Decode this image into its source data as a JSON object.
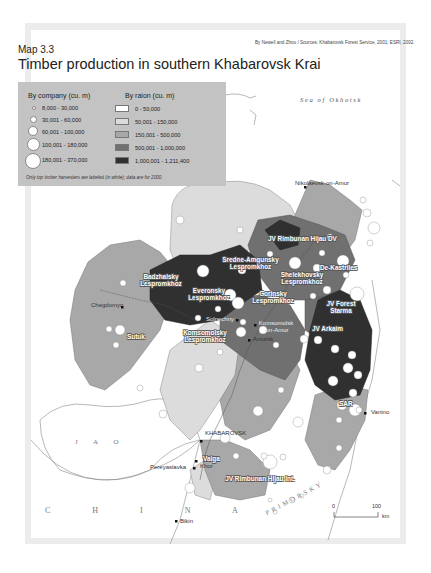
{
  "header": {
    "credit": "By Newell and Zhou / Sources: Khabarovsk Forest Service, 2001; ESRI, 2002.",
    "map_number": "Map 3.3",
    "title": "Timber production in southern Khabarovsk Krai"
  },
  "legend": {
    "company_heading": "By company (cu. m)",
    "company_classes": [
      {
        "label": "8,000 - 30,000",
        "size": 4
      },
      {
        "label": "30,001 - 60,000",
        "size": 7
      },
      {
        "label": "60,001 - 100,000",
        "size": 10
      },
      {
        "label": "100,001 - 180,000",
        "size": 13
      },
      {
        "label": "180,001 - 370,000",
        "size": 16
      }
    ],
    "raion_heading": "By raion (cu. m)",
    "raion_classes": [
      {
        "label": "0 - 50,000",
        "color": "#ffffff"
      },
      {
        "label": "50,001 - 150,000",
        "color": "#dcdcdc"
      },
      {
        "label": "150,001 - 500,000",
        "color": "#a8a8a8"
      },
      {
        "label": "500,001 - 1,000,000",
        "color": "#707070"
      },
      {
        "label": "1,000,001 - 1,211,400",
        "color": "#303030"
      }
    ],
    "note": "Only top timber harvesters are labeled (in white); data are for 2000."
  },
  "colors": {
    "class0": "#ffffff",
    "class1": "#dcdcdc",
    "class2": "#a8a8a8",
    "class3": "#707070",
    "class4": "#303030",
    "frame": "#ececec",
    "legend_bg": "#c3c3c3"
  },
  "labels": {
    "sea": "Sea of Okhotsk",
    "jao": "J A O",
    "china": "C H I N A",
    "primorsky": "PRIMORSKY"
  },
  "companies": [
    "JV Rimbunan Hijau DV",
    "Sredne-Amgunsky Lespromkhoz",
    "Badzhalsky Lespromkhoz",
    "Shelekhovsky Lespromkhoz",
    "De-Kastriles",
    "Everonsky Lespromkhoz",
    "Gorinsky Lespromkhoz",
    "JV Forest Starma",
    "Sutuk",
    "Komsomolsky Lespromkhoz",
    "JV Arkaim",
    "SAR",
    "Vaiga",
    "JV Rimbunan Hijau Int."
  ],
  "cities": [
    "Nikolaevsk-on-Amur",
    "Chegdomyn",
    "Solnechny",
    "Komsomolsk -on-Amur",
    "Amursk",
    "Vanino",
    "KHABAROVSK",
    "Pereyaslavka",
    "Khor",
    "Bikin"
  ],
  "scale": {
    "zero": "0",
    "max": "100",
    "unit": "km"
  }
}
